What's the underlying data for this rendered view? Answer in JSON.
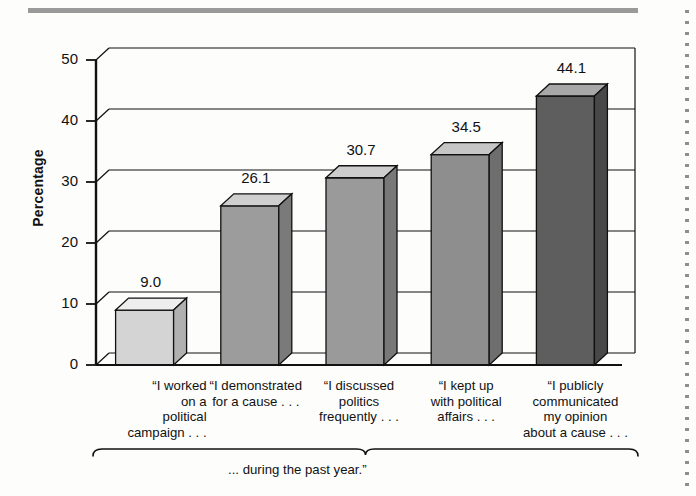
{
  "figure": {
    "top_rule": "decorative-rule",
    "perforation": "dotted-edge"
  },
  "axis": {
    "y_title": "Percentage",
    "y_ticks": [
      "0",
      "10",
      "20",
      "30",
      "40",
      "50"
    ],
    "bracket_caption": "... during the past year.”"
  },
  "chart_data": {
    "type": "bar",
    "title": "",
    "subtitle": "",
    "xlabel": "... during the past year.”",
    "ylabel": "Percentage",
    "ylim": [
      0,
      50
    ],
    "ytick_values": [
      0,
      10,
      20,
      30,
      40,
      50
    ],
    "grid": true,
    "legend": "none",
    "style": "3d-column",
    "categories": [
      "“I worked on a political campaign . . .",
      "“I demonstrated for a cause . . .",
      "“I discussed politics frequently . . .",
      "“I kept up with political affairs . . .",
      "“I publicly communicated my opinion about a cause . . ."
    ],
    "category_lines": [
      [
        "“I worked",
        "on a",
        "political",
        "campaign . . ."
      ],
      [
        "“I demonstrated",
        "for a cause . . ."
      ],
      [
        "“I discussed",
        "politics",
        "frequently . . ."
      ],
      [
        "“I kept up",
        "with political",
        "affairs . . ."
      ],
      [
        "“I publicly",
        "communicated",
        "my opinion",
        "about a cause . . ."
      ]
    ],
    "values": [
      9.0,
      26.1,
      30.7,
      34.5,
      44.1
    ],
    "value_labels": [
      "9.0",
      "26.1",
      "30.7",
      "34.5",
      "44.1"
    ],
    "bar_colors": [
      "#d4d4d4",
      "#9c9c9c",
      "#9a9a9a",
      "#8e8e8e",
      "#5e5e5e"
    ],
    "bar_top_colors": [
      "#eeeeee",
      "#cfcfcf",
      "#cdcdcd",
      "#c6c6c6",
      "#a8a8a8"
    ],
    "bar_side_colors": [
      "#b0b0b0",
      "#7a7a7a",
      "#787878",
      "#6e6e6e",
      "#484848"
    ]
  },
  "colors": {
    "rule": "#9a9a9a",
    "axis": "#111111",
    "grid": "#111111",
    "background": "#fdfdfc"
  }
}
